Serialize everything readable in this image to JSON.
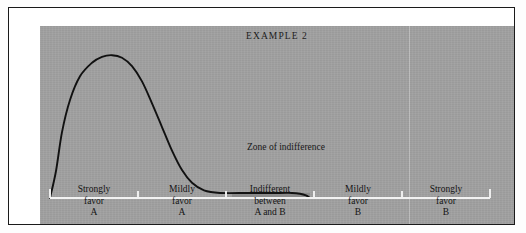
{
  "figure": {
    "title": "EXAMPLE 2",
    "background_color": "#a0a0a0",
    "frame_color": "#1a1a1a",
    "curve_color": "#111111",
    "axis_color": "#f2f2f2",
    "zone_fill_color": "#8a8a8a"
  },
  "annotations": {
    "zone_label_line1": "Zone of",
    "zone_label_line2": "indifference"
  },
  "axis": {
    "categories": [
      {
        "line1": "Strongly",
        "line2": "favor",
        "line3": "A"
      },
      {
        "line1": "Mildly",
        "line2": "favor",
        "line3": "A"
      },
      {
        "line1": "Indifferent",
        "line2": "between",
        "line3": "A and B"
      },
      {
        "line1": "Mildly",
        "line2": "favor",
        "line3": "B"
      },
      {
        "line1": "Strongly",
        "line2": "favor",
        "line3": "B"
      }
    ]
  },
  "chart_data": {
    "type": "area",
    "title": "EXAMPLE 2",
    "xlabel": "",
    "ylabel": "",
    "grid": false,
    "legend": false,
    "axis_ticks_visible": true,
    "categories": [
      "Strongly favor A",
      "Mildly favor A",
      "Indifferent between A and B",
      "Mildly favor B",
      "Strongly favor B"
    ],
    "x_category_boundaries_px": [
      10,
      98,
      186,
      274,
      362,
      450
    ],
    "xlim": [
      0,
      474
    ],
    "ylim": [
      0,
      170
    ],
    "series": [
      {
        "name": "Preference density",
        "points": [
          {
            "x": 10,
            "y": 0
          },
          {
            "x": 16,
            "y": 32
          },
          {
            "x": 22,
            "y": 78
          },
          {
            "x": 30,
            "y": 116
          },
          {
            "x": 40,
            "y": 144
          },
          {
            "x": 52,
            "y": 160
          },
          {
            "x": 62,
            "y": 167
          },
          {
            "x": 72,
            "y": 169
          },
          {
            "x": 82,
            "y": 166
          },
          {
            "x": 92,
            "y": 156
          },
          {
            "x": 102,
            "y": 138
          },
          {
            "x": 112,
            "y": 112
          },
          {
            "x": 122,
            "y": 84
          },
          {
            "x": 132,
            "y": 56
          },
          {
            "x": 142,
            "y": 33
          },
          {
            "x": 152,
            "y": 18
          },
          {
            "x": 164,
            "y": 9
          },
          {
            "x": 180,
            "y": 6
          },
          {
            "x": 210,
            "y": 6
          },
          {
            "x": 240,
            "y": 6
          },
          {
            "x": 252,
            "y": 6
          },
          {
            "x": 260,
            "y": 5
          },
          {
            "x": 266,
            "y": 3
          },
          {
            "x": 270,
            "y": 0
          }
        ]
      }
    ],
    "shaded_regions": [
      {
        "label": "Zone of indifference",
        "x_start": 192,
        "x_end": 270,
        "y_start": 0,
        "y_end": 6,
        "color": "#8a8a8a"
      }
    ]
  }
}
